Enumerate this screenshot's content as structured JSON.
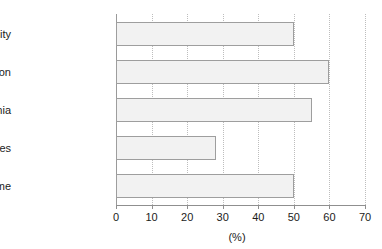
{
  "chart_data": {
    "type": "bar",
    "orientation": "horizontal",
    "title": "",
    "subtitle": "",
    "xlabel": "(%)",
    "ylabel": "",
    "categories": [
      "Obesity",
      "Hypertension",
      "Dyslipidemia",
      "Type 2 diabetes",
      "Metabolic syndrome"
    ],
    "values": [
      50,
      60,
      55,
      28,
      50
    ],
    "series": [
      {
        "name": "Prevalence",
        "values": [
          50,
          60,
          55,
          28,
          50
        ]
      }
    ],
    "xlim": [
      0,
      70
    ],
    "xticks": [
      0,
      10,
      20,
      30,
      40,
      50,
      60,
      70
    ],
    "xtick_labels": [
      "0",
      "10",
      "20",
      "30",
      "40",
      "50",
      "60",
      "70"
    ],
    "grid": true,
    "grid_axis": "x",
    "grid_style": "dotted",
    "legend": false,
    "legend_position": "none",
    "bar_fill_color": "#f2f2f2",
    "bar_border_color": "#9e9e9e",
    "axis_color": "#8f8f8f",
    "grid_color": "#bdbdbd",
    "text_color": "#1b1b1b",
    "background_color": "#ffffff",
    "points": [
      {
        "category": "Obesity",
        "value": 50
      },
      {
        "category": "Hypertension",
        "value": 60
      },
      {
        "category": "Dyslipidemia",
        "value": 55
      },
      {
        "category": "Type 2 diabetes",
        "value": 28
      },
      {
        "category": "Metabolic syndrome",
        "value": 50
      }
    ]
  }
}
